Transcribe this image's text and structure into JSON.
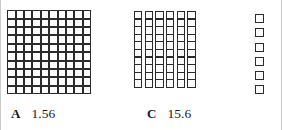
{
  "figure": {
    "type": "base-ten-blocks-decimal-model",
    "background_color": "#ffffff",
    "ink_color": "#2b2b2b"
  },
  "blocks": {
    "flat": {
      "name": "hundred-flat",
      "columns": 10,
      "rows": 10,
      "unit_count": 100
    },
    "rods": {
      "name": "ten-rods",
      "rod_count": 6,
      "cells_per_rod": 10,
      "unit_count": 60
    },
    "units": {
      "name": "unit-cubes",
      "count": 6
    }
  },
  "labels": [
    {
      "id": "a",
      "letter": "A",
      "value": "1.56"
    },
    {
      "id": "c",
      "letter": "C",
      "value": "15.6"
    }
  ]
}
